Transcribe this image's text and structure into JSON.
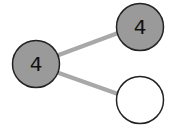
{
  "diagram": {
    "type": "number-bond",
    "colors": {
      "filled": "#9a9a9a",
      "empty": "#ffffff",
      "stroke": "#222222",
      "connector": "#a8a8a8"
    },
    "whole": {
      "value": "4",
      "filled": true
    },
    "parts": [
      {
        "value": "4",
        "filled": true
      },
      {
        "value": "",
        "filled": false
      }
    ]
  }
}
